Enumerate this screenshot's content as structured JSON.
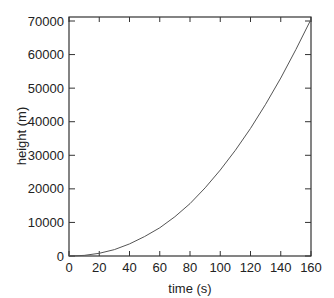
{
  "chart_data": {
    "type": "line",
    "title": "",
    "xlabel": "time (s)",
    "ylabel": "height (m)",
    "xlim": [
      0,
      160
    ],
    "ylim": [
      0,
      72000
    ],
    "x_ticks": [
      0,
      20,
      40,
      60,
      80,
      100,
      120,
      140,
      160
    ],
    "y_ticks": [
      0,
      10000,
      20000,
      30000,
      40000,
      50000,
      60000,
      70000
    ],
    "grid": false,
    "legend": null,
    "series": [
      {
        "name": "height",
        "color": "#555555",
        "x": [
          0,
          10,
          20,
          30,
          40,
          50,
          60,
          70,
          80,
          90,
          100,
          110,
          120,
          130,
          140,
          150,
          160
        ],
        "values": [
          0,
          180,
          800,
          1900,
          3600,
          5800,
          8400,
          11700,
          15600,
          20300,
          25600,
          31500,
          38000,
          45200,
          53000,
          61500,
          70500
        ]
      }
    ]
  }
}
